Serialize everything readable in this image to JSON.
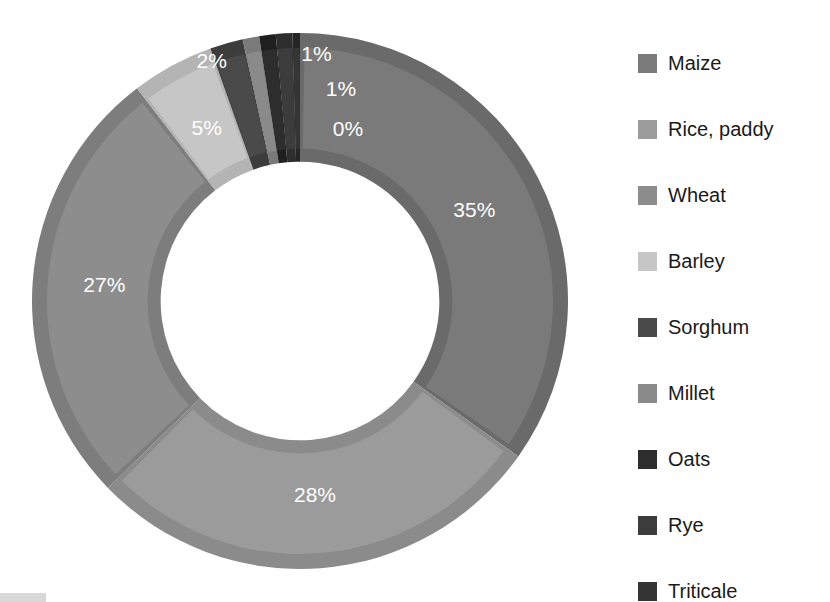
{
  "chart_data": {
    "type": "pie",
    "variant": "donut",
    "title": "",
    "subtitle": "",
    "xlabel": "",
    "ylabel": "",
    "grid": false,
    "legend_position": "right",
    "start_angle_deg": 0,
    "direction": "clockwise",
    "inner_radius_ratio": 0.52,
    "categories": [
      "Maize",
      "Rice, paddy",
      "Wheat",
      "Barley",
      "Sorghum",
      "Millet",
      "Oats",
      "Rye",
      "Triticale"
    ],
    "values": [
      35,
      28,
      27,
      5,
      2,
      1,
      1,
      1,
      0
    ],
    "value_labels": [
      "35%",
      "28%",
      "27%",
      "5%",
      "2%",
      "1%",
      "1%",
      "1%",
      "0%"
    ],
    "colors": [
      "#7a7a7a",
      "#9b9b9b",
      "#8d8d8d",
      "#c6c6c6",
      "#4a4a4a",
      "#8a8a8a",
      "#2d2d2d",
      "#3c3c3c",
      "#353535"
    ],
    "edge_colors": [
      "#6a6a6a",
      "#8b8b8b",
      "#7d7d7d",
      "#b4b4b4",
      "#3c3c3c",
      "#7a7a7a",
      "#1f1f1f",
      "#2e2e2e",
      "#262626"
    ],
    "label_color": "#ffffff"
  },
  "legend": {
    "items": [
      {
        "label": "Maize",
        "color": "#7a7a7a"
      },
      {
        "label": "Rice, paddy",
        "color": "#9b9b9b"
      },
      {
        "label": "Wheat",
        "color": "#8d8d8d"
      },
      {
        "label": "Barley",
        "color": "#c6c6c6"
      },
      {
        "label": "Sorghum",
        "color": "#4a4a4a"
      },
      {
        "label": "Millet",
        "color": "#8a8a8a"
      },
      {
        "label": "Oats",
        "color": "#2d2d2d"
      },
      {
        "label": "Rye",
        "color": "#3c3c3c"
      },
      {
        "label": "Triticale",
        "color": "#353535"
      }
    ]
  }
}
